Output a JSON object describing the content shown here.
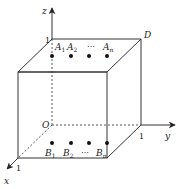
{
  "diagram": {
    "type": "3d-unit-cube",
    "colors": {
      "stroke": "#333333",
      "dot": "#111111",
      "background": "#ffffff"
    },
    "axes": {
      "x": {
        "label": "x",
        "tick": "1"
      },
      "y": {
        "label": "y",
        "tick": "1"
      },
      "z": {
        "label": "z",
        "tick": "1"
      },
      "origin": "O"
    },
    "vertex_labels": {
      "D": "D"
    },
    "top_points": {
      "labels": [
        "A",
        "A",
        "⋯",
        "A"
      ],
      "subscripts": [
        "1",
        "2",
        "",
        "n"
      ]
    },
    "bottom_points": {
      "labels": [
        "B",
        "B",
        "⋯",
        "B"
      ],
      "subscripts": [
        "1",
        "2",
        "",
        "n"
      ]
    }
  }
}
